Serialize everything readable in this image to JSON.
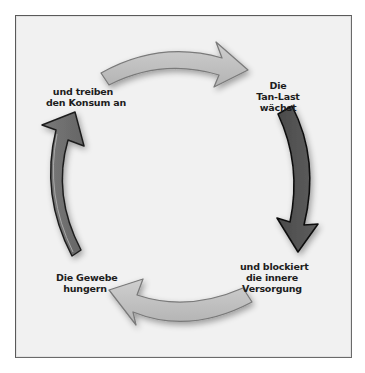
{
  "diagram": {
    "type": "cycle",
    "direction": "clockwise",
    "colors": {
      "background": "#f1f1f1",
      "frame_border": "#5a5a5a",
      "light_arrow": "#bdbdbd",
      "dark_arrow": "#555555",
      "medium_arrow": "#6d6d6d",
      "text": "#1d1d1d"
    },
    "nodes": [
      {
        "id": "tan-last",
        "lines": [
          "Die",
          "Tan-Last",
          "wächst"
        ]
      },
      {
        "id": "blockiert",
        "lines": [
          "und blockiert",
          "die innere",
          "Versorgung"
        ]
      },
      {
        "id": "gewebe",
        "lines": [
          "Die Gewebe",
          "hungern"
        ]
      },
      {
        "id": "konsum",
        "lines": [
          "und treiben",
          "den Konsum an"
        ]
      }
    ],
    "arrows": [
      {
        "from": "konsum",
        "to": "tan-last",
        "position": "top",
        "shade": "light"
      },
      {
        "from": "tan-last",
        "to": "blockiert",
        "position": "right",
        "shade": "dark"
      },
      {
        "from": "blockiert",
        "to": "gewebe",
        "position": "bottom",
        "shade": "light"
      },
      {
        "from": "gewebe",
        "to": "konsum",
        "position": "left",
        "shade": "medium"
      }
    ]
  }
}
